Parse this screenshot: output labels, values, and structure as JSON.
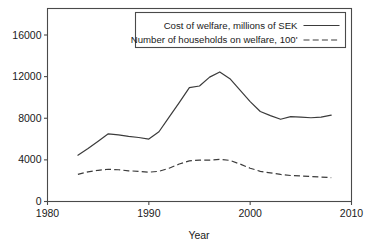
{
  "chart_data": {
    "type": "line",
    "title": "",
    "xlabel": "Year",
    "ylabel": "",
    "xlim": [
      1980,
      2010
    ],
    "ylim": [
      0,
      17500
    ],
    "xticks": [
      1980,
      1990,
      2000,
      2010
    ],
    "xtick_labels": [
      "1980",
      "1990",
      "2000",
      "2010"
    ],
    "yticks": [
      0,
      4000,
      8000,
      12000,
      16000
    ],
    "ytick_labels": [
      "0",
      "4000",
      "8000",
      "12000",
      "16000"
    ],
    "grid": false,
    "legend_position": "top-right",
    "x": [
      1983,
      1984,
      1985,
      1986,
      1987,
      1988,
      1989,
      1990,
      1991,
      1992,
      1993,
      1994,
      1995,
      1996,
      1997,
      1998,
      1999,
      2000,
      2001,
      2002,
      2003,
      2004,
      2005,
      2006,
      2007,
      2008
    ],
    "series": [
      {
        "name": "Cost of welfare, millions of SEK",
        "style": "solid",
        "values": [
          4450,
          5100,
          5800,
          6500,
          6400,
          6250,
          6150,
          6000,
          6700,
          8100,
          9500,
          10950,
          11100,
          11950,
          12450,
          11800,
          10700,
          9600,
          8650,
          8250,
          7900,
          8150,
          8100,
          8050,
          8100,
          8300
        ]
      },
      {
        "name": "Number of households on welfare, 100'",
        "style": "dashed",
        "values": [
          2600,
          2850,
          3000,
          3100,
          3050,
          2950,
          2900,
          2820,
          2900,
          3200,
          3600,
          3900,
          3980,
          3980,
          4050,
          3950,
          3600,
          3200,
          2900,
          2750,
          2600,
          2500,
          2450,
          2400,
          2350,
          2300
        ]
      }
    ]
  },
  "legend": {
    "entries": [
      {
        "label": "Cost of welfare, millions of SEK",
        "style": "solid"
      },
      {
        "label": "Number of households on welfare, 100'",
        "style": "dashed"
      }
    ]
  }
}
